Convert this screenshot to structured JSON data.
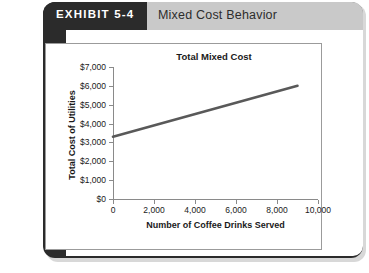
{
  "exhibit": {
    "tab_label": "EXHIBIT 5-4",
    "header_title": "Mixed Cost Behavior"
  },
  "colors": {
    "tab_background": "#2b2b2b",
    "tab_text": "#ffffff",
    "header_band": "#c9c9c9",
    "header_text": "#2d2d2d",
    "chart_border": "#9b9b9b",
    "axis": "#8a8a8a",
    "line": "#595959",
    "card_background": "#ffffff"
  },
  "chart_data": {
    "type": "line",
    "title": "Total Mixed Cost",
    "xlabel": "Number of Coffee Drinks Served",
    "ylabel": "Total Cost of Utilities",
    "xlim": [
      0,
      10000
    ],
    "ylim": [
      0,
      7000
    ],
    "grid": false,
    "legend": null,
    "xticks": [
      0,
      2000,
      4000,
      6000,
      8000,
      10000
    ],
    "xtick_labels": [
      "0",
      "2,000",
      "4,000",
      "6,000",
      "8,000",
      "10,000"
    ],
    "yticks": [
      0,
      1000,
      2000,
      3000,
      4000,
      5000,
      6000,
      7000
    ],
    "ytick_labels": [
      "$0",
      "$1,000",
      "$2,000",
      "$3,000",
      "$4,000",
      "$5,000",
      "$6,000",
      "$7,000"
    ],
    "series": [
      {
        "name": "Total Mixed Cost",
        "x": [
          0,
          9000
        ],
        "y": [
          3300,
          6000
        ]
      }
    ]
  }
}
